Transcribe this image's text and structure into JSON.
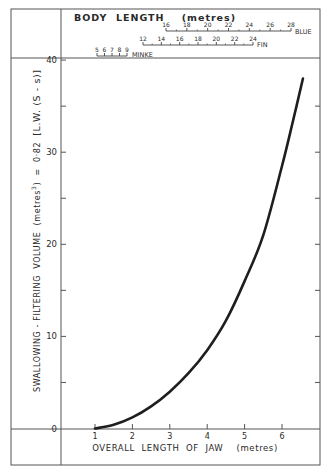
{
  "chart_data": {
    "type": "line",
    "title": "",
    "xlabel": "OVERALL LENGTH OF JAW (metres)",
    "ylabel": "SWALLOWING - FILTERING VOLUME (metres³) = 0·82 [L.W.(S-s)]",
    "xlim": [
      0.0,
      6.9
    ],
    "ylim": [
      0,
      40
    ],
    "x_ticks": [
      1,
      2,
      3,
      4,
      5,
      6
    ],
    "y_ticks": [
      0,
      10,
      20,
      30,
      40
    ],
    "grid": false,
    "legend": null,
    "series": [
      {
        "name": "Swallowing-filtering volume",
        "x": [
          1.0,
          1.5,
          2.0,
          2.5,
          3.0,
          3.5,
          4.0,
          4.5,
          5.0,
          5.5,
          6.0,
          6.3,
          6.56
        ],
        "values": [
          0.0,
          0.4,
          1.2,
          2.4,
          4.0,
          6.0,
          8.5,
          11.7,
          16.0,
          21.0,
          28.5,
          33.5,
          38.0
        ]
      }
    ],
    "secondary_axes": {
      "title": "BODY LENGTH (metres)",
      "scales": [
        {
          "name": "BLUE",
          "ticks": [
            16,
            18,
            20,
            22,
            24,
            26,
            28
          ]
        },
        {
          "name": "FIN",
          "ticks": [
            12,
            14,
            16,
            18,
            20,
            22,
            24
          ]
        },
        {
          "name": "MINKE",
          "ticks": [
            5,
            6,
            7,
            8,
            9
          ]
        }
      ]
    }
  },
  "labels": {
    "body_length_title": "BODY  LENGTH    (metres)",
    "blue": "BLUE",
    "fin": "FIN",
    "minke": "MINKE",
    "x_axis_title": "OVERALL  LENGTH  OF  JAW    (metres)",
    "y_axis_title_main": "SWALLOWING - FILTERING  VOLUME  (metres",
    "y_axis_title_sup": "3",
    "y_axis_title_eq": ")  =  0·82",
    "y_axis_title_bracket": "[L.W. (S - s)]"
  },
  "x_tick_labels": [
    "1",
    "2",
    "3",
    "4",
    "5",
    "6"
  ],
  "y_tick_labels": [
    "0",
    "10",
    "20",
    "30",
    "40"
  ],
  "blue_tick_labels": [
    "16",
    "18",
    "20",
    "22",
    "24",
    "26",
    "28"
  ],
  "fin_tick_labels": [
    "12",
    "14",
    "16",
    "18",
    "20",
    "22",
    "24"
  ],
  "minke_tick_labels": [
    "5",
    "6",
    "7",
    "8",
    "9"
  ]
}
